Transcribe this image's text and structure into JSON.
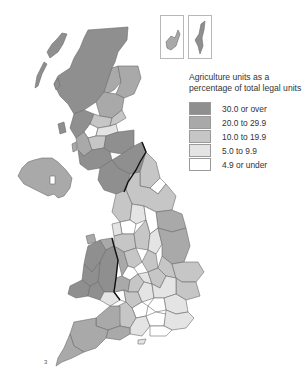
{
  "legend": {
    "title_line1": "Agriculture units as a",
    "title_line2": "percentage of total legal units",
    "items": [
      {
        "label": "30.0 or over",
        "color": "#8f8f8f"
      },
      {
        "label": "20.0 to 29.9",
        "color": "#a9a9a9"
      },
      {
        "label": "10.0 to 19.9",
        "color": "#c6c6c6"
      },
      {
        "label": "5.0 to 9.9",
        "color": "#e4e4e4"
      },
      {
        "label": "4.9 or under",
        "color": "#ffffff"
      }
    ]
  },
  "insets": {
    "orkney": "Orkney Islands",
    "shetland": "Shetland Islands"
  },
  "footnote": "3"
}
